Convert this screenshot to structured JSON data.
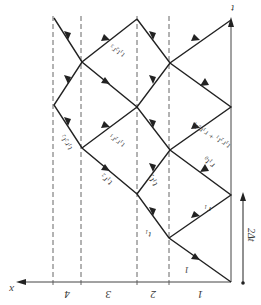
{
  "diagram": {
    "orientation": "rotated 180 degrees",
    "axes": {
      "x_label": "x",
      "t_label": "t"
    },
    "layers": [
      "1",
      "2",
      "3",
      "4"
    ],
    "interval_label": "2Δt",
    "ray_labels": {
      "incident": "1",
      "t1": "t₁",
      "r1": "r₁",
      "r1t0": "r₁t₀",
      "t1t2": "t₁t₂",
      "t1r2": "t₁r₂",
      "t1r2t1_r1r0t1": "t₁r₂t₁ + r₁r₀t₁",
      "t1r2r1": "t₁r₂r₁",
      "t1r2t2": "t₁r₂t₂",
      "t1t2r3": "t₁t₂r₃"
    },
    "colors": {
      "line": "#222222",
      "dashed": "#555555",
      "background": "#ffffff"
    }
  }
}
